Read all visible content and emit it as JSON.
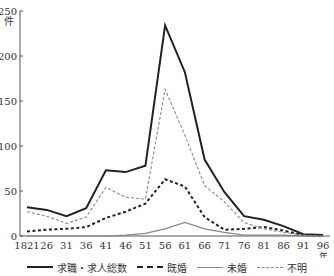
{
  "chart_data": {
    "type": "line",
    "title": "",
    "xlabel": "年",
    "ylabel": "件",
    "ylim": [
      0,
      250
    ],
    "yticks": [
      0,
      50,
      100,
      150,
      200,
      250
    ],
    "grid": false,
    "legend_position": "bottom",
    "x": [
      "1821",
      "26",
      "31",
      "36",
      "41",
      "46",
      "51",
      "56",
      "61",
      "66",
      "71",
      "76",
      "81",
      "86",
      "91",
      "96"
    ],
    "series": [
      {
        "name": "求職・求人総数",
        "style": "solid-thick",
        "color": "#222222",
        "values": [
          32,
          29,
          22,
          31,
          73,
          71,
          78,
          234,
          182,
          85,
          49,
          22,
          18,
          11,
          2,
          1
        ]
      },
      {
        "name": "既婚",
        "style": "dashed-thick",
        "color": "#222222",
        "values": [
          5,
          7,
          8,
          10,
          20,
          27,
          36,
          63,
          55,
          21,
          7,
          8,
          10,
          6,
          1,
          0
        ]
      },
      {
        "name": "未婚",
        "style": "solid-thin",
        "color": "#888888",
        "values": [
          0,
          0,
          0,
          0,
          0,
          1,
          3,
          8,
          15,
          8,
          4,
          1,
          1,
          1,
          0,
          0
        ]
      },
      {
        "name": "不明",
        "style": "dashed-thin",
        "color": "#888888",
        "values": [
          27,
          22,
          14,
          21,
          54,
          43,
          41,
          163,
          112,
          56,
          38,
          15,
          8,
          4,
          1,
          0
        ]
      }
    ]
  }
}
